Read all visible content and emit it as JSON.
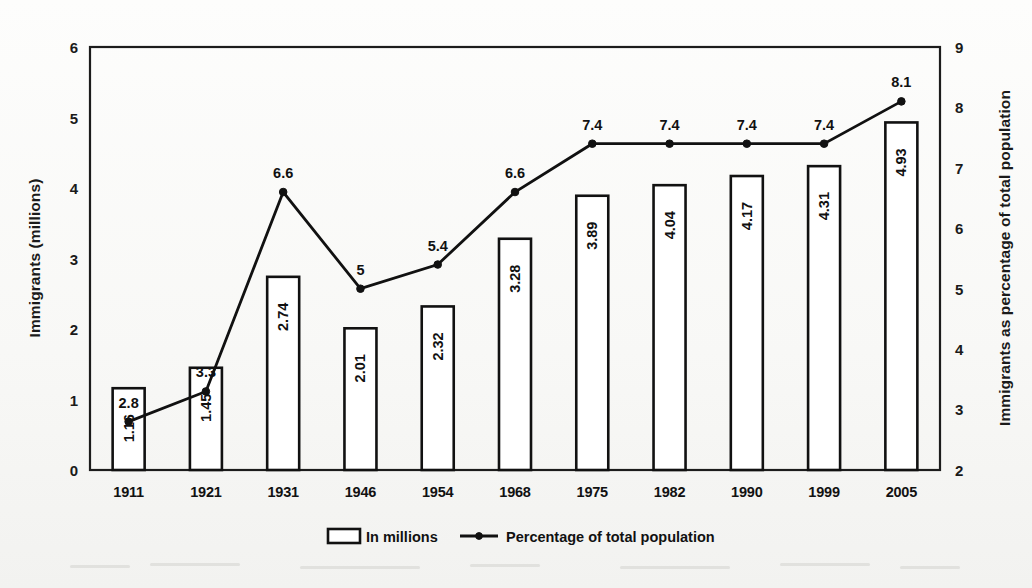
{
  "chart_data": {
    "type": "bar",
    "title": "",
    "subtitle": "",
    "xlabel": "",
    "ylabel": "Immigrants (millions)",
    "y2label": "Immigrants as percentage of total population",
    "categories": [
      "1911",
      "1921",
      "1931",
      "1946",
      "1954",
      "1968",
      "1975",
      "1982",
      "1990",
      "1999",
      "2005"
    ],
    "ylim": [
      0,
      6
    ],
    "y2lim": [
      2,
      9
    ],
    "yticks": [
      "0",
      "1",
      "2",
      "3",
      "4",
      "5",
      "6"
    ],
    "y2ticks": [
      "2",
      "3",
      "4",
      "5",
      "6",
      "7",
      "8",
      "9"
    ],
    "grid": false,
    "legend_position": "bottom",
    "series": [
      {
        "name": "In millions",
        "type": "bar",
        "axis": "left",
        "values": [
          1.16,
          1.45,
          2.74,
          2.01,
          2.32,
          3.28,
          3.89,
          4.04,
          4.17,
          4.31,
          4.93
        ],
        "labels": [
          "1.16",
          "1.45",
          "2.74",
          "2.01",
          "2.32",
          "3.28",
          "3.89",
          "4.04",
          "4.17",
          "4.31",
          "4.93"
        ]
      },
      {
        "name": "Percentage of total population",
        "type": "line",
        "axis": "right",
        "values": [
          2.8,
          3.3,
          6.6,
          5.0,
          5.4,
          6.6,
          7.4,
          7.4,
          7.4,
          7.4,
          8.1
        ],
        "labels": [
          "2.8",
          "3.3",
          "6.6",
          "5",
          "5.4",
          "6.6",
          "7.4",
          "7.4",
          "7.4",
          "7.4",
          "8.1"
        ]
      }
    ]
  },
  "legend": {
    "items": [
      {
        "label": "In millions",
        "marker": "rect-outline-icon"
      },
      {
        "label": "Percentage of total population",
        "marker": "line-dot-icon"
      }
    ]
  },
  "axes": {
    "left_title": "Immigrants (millions)",
    "right_title": "Immigrants as percentage of total population"
  },
  "colors": {
    "ink": "#111111",
    "frame": "#1c1c1c",
    "bar_fill": "#ffffff",
    "background": "#fbfbfa"
  }
}
